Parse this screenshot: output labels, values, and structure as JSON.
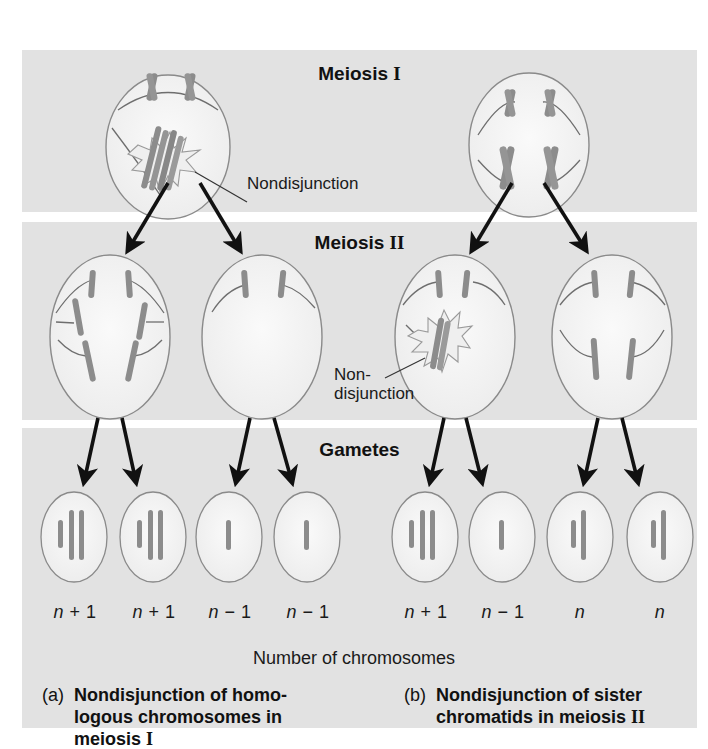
{
  "figure": {
    "panels": [
      {
        "id": "meiosis-1",
        "title": "Meiosis ",
        "roman": "I",
        "top": 50,
        "height": 162
      },
      {
        "id": "meiosis-2",
        "title": "Meiosis ",
        "roman": "II",
        "top": 222,
        "height": 198
      },
      {
        "id": "gametes",
        "title": "Gametes",
        "roman": "",
        "top": 428,
        "height": 300
      }
    ],
    "annotations": {
      "nondisjunction_1": "Nondisjunction",
      "nondisjunction_2_line1": "Non-",
      "nondisjunction_2_line2": "disjunction"
    },
    "gamete_counts": [
      {
        "n": "n",
        "op": " + 1"
      },
      {
        "n": "n",
        "op": " + 1"
      },
      {
        "n": "n",
        "op": " − 1"
      },
      {
        "n": "n",
        "op": " − 1"
      },
      {
        "n": "n",
        "op": " + 1"
      },
      {
        "n": "n",
        "op": " − 1"
      },
      {
        "n": "n",
        "op": ""
      },
      {
        "n": "n",
        "op": ""
      }
    ],
    "axis_label": "Number of chromosomes",
    "captions": {
      "a_tag": "(a)",
      "a_line1": "Nondisjunction of homo-",
      "a_line2": "logous chromosomes in",
      "a_line3": "meiosis ",
      "a_roman": "I",
      "b_tag": "(b)",
      "b_line1": "Nondisjunction of sister",
      "b_line2": "chromatids in meiosis ",
      "b_roman": "II"
    },
    "colors": {
      "panel_bg": "#e2e2e2",
      "cell_fill": "#f4f4f4",
      "cell_stroke": "#8a8a8a",
      "chromosome": "#8c8c8c",
      "spindle": "#6e6e6e",
      "arrow": "#111111"
    }
  }
}
